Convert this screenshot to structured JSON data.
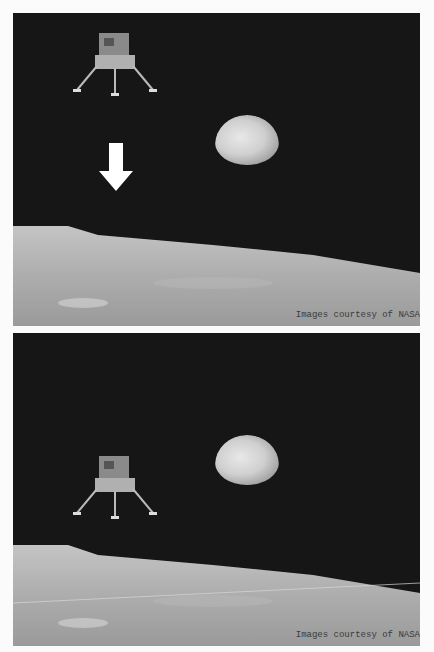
{
  "panels": [
    {
      "id": "before",
      "elements": [
        "lunar-module",
        "down-arrow",
        "earth",
        "lunar-horizon"
      ],
      "credit": "Images courtesy of NASA"
    },
    {
      "id": "after",
      "elements": [
        "lunar-module",
        "earth",
        "lunar-horizon"
      ],
      "credit": "Images courtesy of NASA"
    }
  ],
  "colors": {
    "sky": "#161616",
    "surface": "#a8a8a8",
    "background": "#fbfbfb",
    "arrow": "#ffffff"
  }
}
